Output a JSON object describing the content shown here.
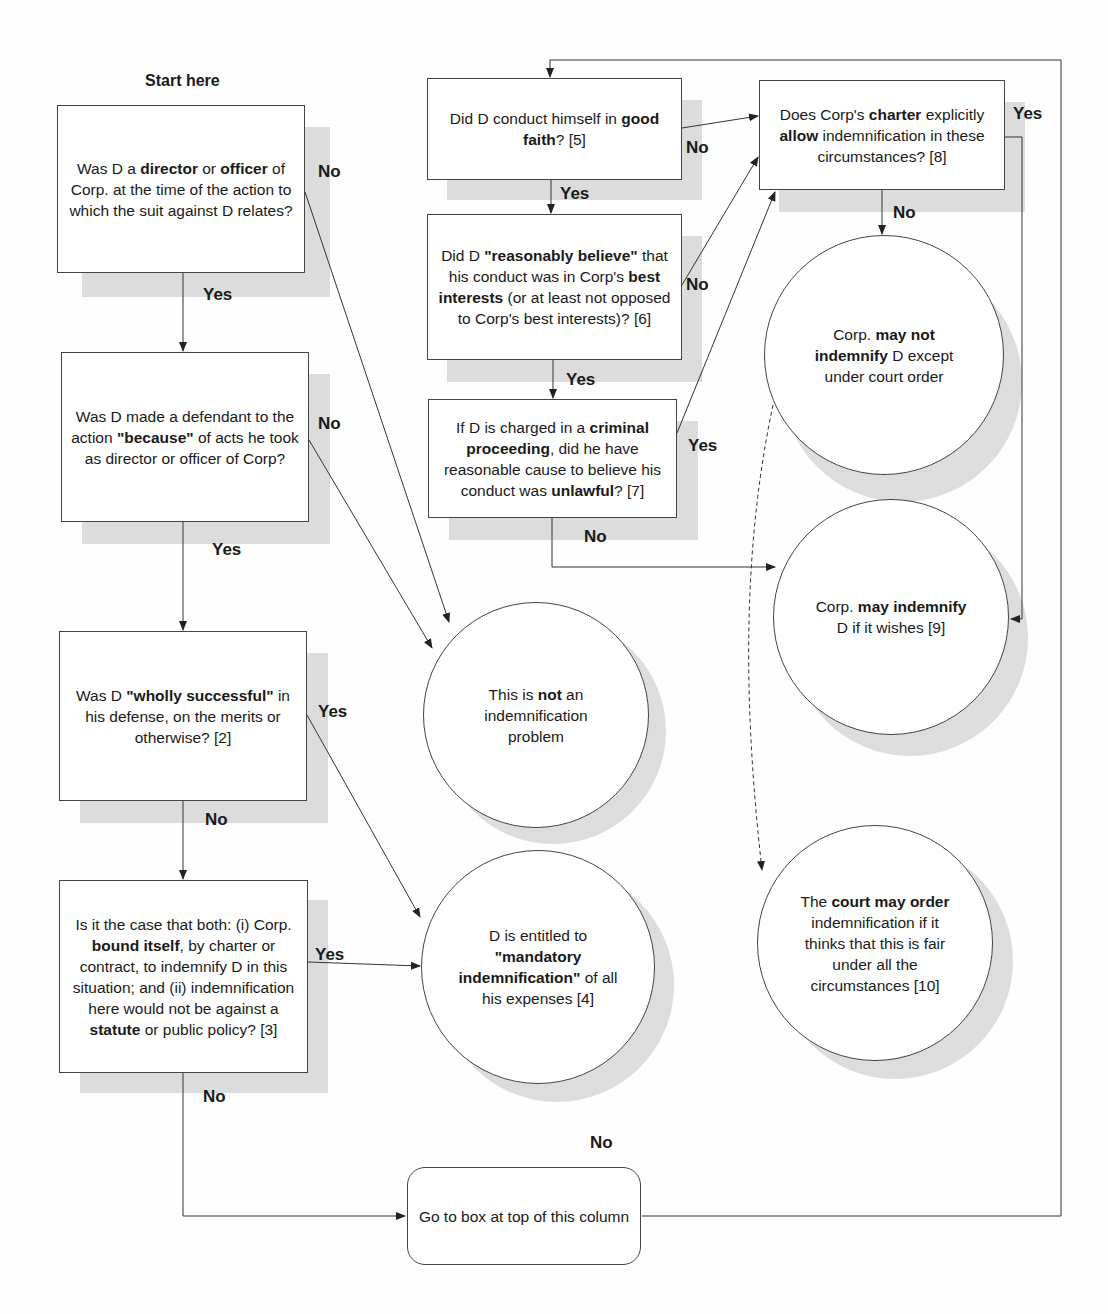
{
  "title": "Start here",
  "boxes": {
    "director_officer": {
      "pre": "Was D a ",
      "b1": "director",
      "mid": " or ",
      "b2": "officer",
      "post": " of Corp. at the time of the action to which the suit against D relates?"
    },
    "because": {
      "pre": "Was D made a defendant to the action ",
      "b1": "\"because\"",
      "post": " of acts he took as director or officer of Corp?"
    },
    "wholly_successful": {
      "pre": "Was D ",
      "b1": "\"wholly successful\"",
      "post": " in his defense, on the merits or otherwise? [2]"
    },
    "bound_itself": {
      "pre": "Is it the case that both: (i) Corp. ",
      "b1": "bound itself",
      "mid": ", by charter or contract, to indemnify D in this situation; and (ii) indemnification here would not be against a ",
      "b2": "statute",
      "post": " or public policy? [3]"
    },
    "good_faith": {
      "pre": "Did D conduct himself in ",
      "b1": "good faith",
      "post": "? [5]"
    },
    "reasonably_believe": {
      "pre": "Did D ",
      "b1": "\"reasonably believe\"",
      "mid": " that his conduct was in Corp's ",
      "b2": "best interests",
      "post": " (or at least not opposed to Corp's best interests)? [6]"
    },
    "criminal": {
      "pre": "If D is charged in a ",
      "b1": "criminal proceeding",
      "mid": ", did he have reasonable cause to believe his conduct was ",
      "b2": "unlawful",
      "post": "? [7]"
    },
    "charter": {
      "pre": "Does Corp's ",
      "b1": "charter",
      "mid": " explicitly ",
      "b2": "allow",
      "post": " indemnification in these circumstances? [8]"
    },
    "goto": {
      "text": "Go to box at top of this column"
    }
  },
  "circles": {
    "not_problem": {
      "pre": "This is ",
      "b1": "not",
      "post": " an indemnification problem"
    },
    "mandatory": {
      "pre": "D is entitled to ",
      "b1": "\"mandatory indemnification\"",
      "post": " of all his expenses  [4]"
    },
    "may_not": {
      "pre": "Corp. ",
      "b1": "may not indemnify",
      "post": " D except under court order"
    },
    "may": {
      "pre": "Corp. ",
      "b1": "may indemnify",
      "post": " D if it wishes [9]"
    },
    "court": {
      "pre": "The ",
      "b1": "court may order",
      "post": " indemnification if it thinks that this is fair under all the circumstances [10]"
    }
  },
  "labels": {
    "b1_no": "No",
    "b1_yes": "Yes",
    "b2_no": "No",
    "b2_yes": "Yes",
    "b3_yes": "Yes",
    "b3_no": "No",
    "b4_yes": "Yes",
    "b4_no": "No",
    "b5_no": "No",
    "b5_yes": "Yes",
    "b6_no": "No",
    "b6_yes": "Yes",
    "b7_yes": "Yes",
    "b7_no": "No",
    "b8_yes": "Yes",
    "b8_no": "No",
    "circle_no": "No"
  }
}
